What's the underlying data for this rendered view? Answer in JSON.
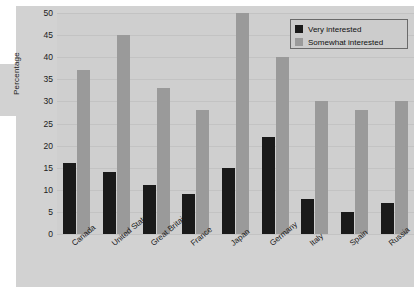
{
  "chart_data": {
    "type": "bar",
    "title": "",
    "xlabel": "",
    "ylabel": "Percentage",
    "ylim": [
      0,
      50
    ],
    "yticks": [
      0,
      5,
      10,
      15,
      20,
      25,
      30,
      35,
      40,
      45,
      50
    ],
    "grid": true,
    "legend_position": "top-right",
    "categories": [
      "Canada",
      "United States",
      "Great Britain",
      "France",
      "Japan",
      "Germany",
      "Italy",
      "Spain",
      "Russia"
    ],
    "series": [
      {
        "name": "Very interested",
        "color": "#1a1a1a",
        "values": [
          16,
          14,
          11,
          9,
          15,
          22,
          8,
          5,
          7
        ]
      },
      {
        "name": "Somewhat interested",
        "color": "#9a9a9a",
        "values": [
          37,
          45,
          33,
          28,
          50,
          40,
          30,
          28,
          30
        ]
      }
    ]
  },
  "colors": {
    "figure_background": "#ffffff",
    "panel_background": "#d2d2d2",
    "plot_background": "#cfcfcf",
    "gridline": "#c3c3c3",
    "legend_background": "#cccccc",
    "legend_border": "#6a6a6a",
    "text": "#1b1b1b"
  }
}
